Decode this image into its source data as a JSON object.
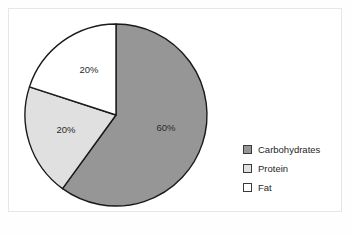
{
  "chart_data": {
    "type": "pie",
    "title": "",
    "categories": [
      "Carbohydrates",
      "Protein",
      "Fat"
    ],
    "values": [
      60,
      20,
      20
    ],
    "value_labels": [
      "60%",
      "20%",
      "20%"
    ],
    "colors": [
      "#969696",
      "#e0e0e0",
      "#ffffff"
    ],
    "slice_outline_color": "#1a1a1a",
    "start_angle_deg": 0,
    "direction": "clockwise",
    "legend_position": "right",
    "grid": false,
    "labels": [
      {
        "text": "60%",
        "category": "Carbohydrates",
        "x": 166,
        "y": 128
      },
      {
        "text": "20%",
        "category": "Protein",
        "x": 66,
        "y": 130
      },
      {
        "text": "20%",
        "category": "Fat",
        "x": 89,
        "y": 70
      }
    ],
    "slices": [
      {
        "name": "Carbohydrates",
        "value": 60,
        "label": "60%",
        "color": "#969696",
        "start_deg": 0,
        "end_deg": 216
      },
      {
        "name": "Protein",
        "value": 20,
        "label": "20%",
        "color": "#e0e0e0",
        "start_deg": 216,
        "end_deg": 288
      },
      {
        "name": "Fat",
        "value": 20,
        "label": "20%",
        "color": "#ffffff",
        "start_deg": 288,
        "end_deg": 360
      }
    ],
    "geometry": {
      "center_x": 116,
      "center_y": 115,
      "radius": 91
    }
  },
  "legend": {
    "items": [
      {
        "label": "Carbohydrates",
        "color": "#969696"
      },
      {
        "label": "Protein",
        "color": "#e0e0e0"
      },
      {
        "label": "Fat",
        "color": "#ffffff"
      }
    ]
  }
}
